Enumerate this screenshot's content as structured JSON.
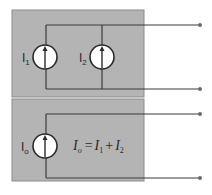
{
  "diagram": {
    "colors": {
      "box_fill": "#b4b4b4",
      "box_border": "#8c8c8c",
      "wire": "#3a3a3a",
      "source_fill": "#ffffff",
      "terminal": "#6a6a6a",
      "text": "#2a2a2a"
    },
    "top_circuit": {
      "sources": [
        {
          "id": "I1",
          "label_main": "I",
          "label_sub": "1"
        },
        {
          "id": "I2",
          "label_main": "I",
          "label_sub": "2"
        }
      ],
      "terminals": [
        "top",
        "bottom"
      ]
    },
    "bottom_circuit": {
      "source": {
        "id": "Io",
        "label_main": "I",
        "label_sub": "o"
      },
      "equation": {
        "lhs_main": "I",
        "lhs_sub": "o",
        "equals": "=",
        "term1_main": "I",
        "term1_sub": "1",
        "plus": "+",
        "term2_main": "I",
        "term2_sub": "2"
      },
      "terminals": [
        "top",
        "bottom"
      ]
    }
  }
}
